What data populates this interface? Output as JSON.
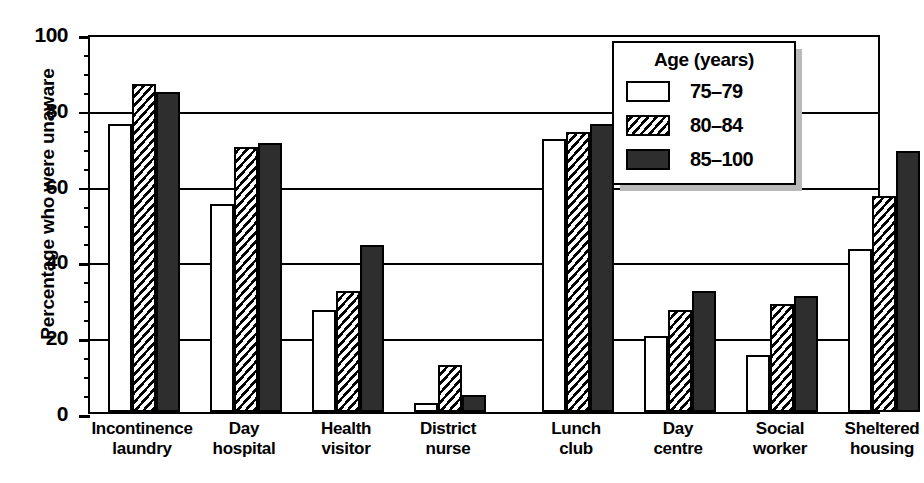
{
  "chart_data": {
    "type": "bar",
    "title": "",
    "xlabel": "",
    "ylabel": "Percentage who were unaware",
    "ylim": [
      0,
      100
    ],
    "yticks": [
      0,
      20,
      40,
      60,
      80,
      100
    ],
    "grid": true,
    "legend_position": "top-right",
    "legend_title": "Age (years)",
    "categories": [
      "Incontinence laundry",
      "Day hospital",
      "Health visitor",
      "District nurse",
      "Lunch club",
      "Day centre",
      "Social worker",
      "Sheltered housing"
    ],
    "category_lines": [
      [
        "Incontinence",
        "laundry"
      ],
      [
        "Day",
        "hospital"
      ],
      [
        "Health",
        "visitor"
      ],
      [
        "District",
        "nurse"
      ],
      [
        "Lunch",
        "club"
      ],
      [
        "Day",
        "centre"
      ],
      [
        "Social",
        "worker"
      ],
      [
        "Sheltered",
        "housing"
      ]
    ],
    "series": [
      {
        "name": "75–79",
        "fill": "white",
        "values": [
          76,
          55,
          27,
          2.5,
          72,
          20,
          15,
          43
        ]
      },
      {
        "name": "80–84",
        "fill": "hatch",
        "values": [
          86.5,
          70,
          32,
          12.5,
          74,
          27,
          28.5,
          57
        ]
      },
      {
        "name": "85–100",
        "fill": "solid",
        "values": [
          84.5,
          71,
          44,
          4.5,
          76,
          32,
          30.5,
          69
        ]
      }
    ],
    "colors": {
      "axis": "#000000",
      "bar_white": "#ffffff",
      "bar_hatch": "#000000",
      "bar_solid": "#2e2e2e",
      "background": "#ffffff"
    }
  }
}
